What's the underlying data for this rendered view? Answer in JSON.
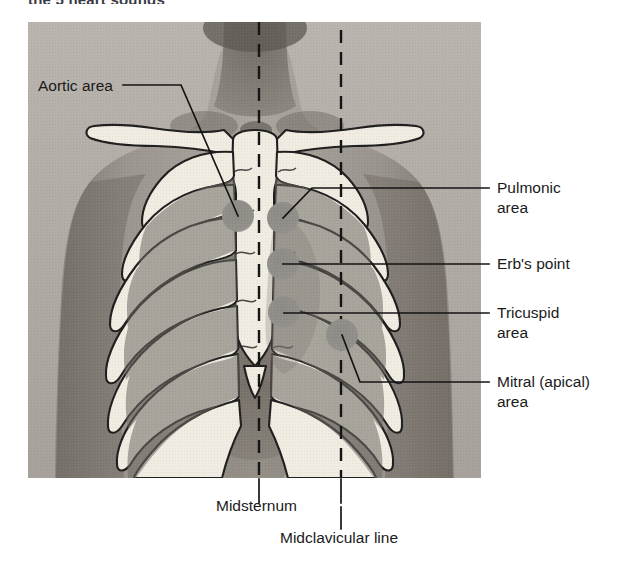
{
  "figure": {
    "title_clipped": "the 5 heart sounds",
    "kind": "anatomical-diagram"
  },
  "photo": {
    "alt_name": "male-torso-photograph",
    "overlay_name": "rib-cage-sternum-illustration",
    "bone_color": "#f0ece2",
    "bone_outline": "#1f1f1f",
    "shadow_color": "#6e6a64",
    "skin_mid": "#9a9591",
    "skin_light": "#c3bfb9",
    "skin_dark": "#6d6862",
    "marker_color": "#8d8a85",
    "line_color": "#1a1a1a"
  },
  "labels": {
    "aortic": "Aortic area",
    "pulmonic_line1": "Pulmonic",
    "pulmonic_line2": "area",
    "erbs": "Erb's point",
    "tricuspid_line1": "Tricuspid",
    "tricuspid_line2": "area",
    "mitral_line1": "Mitral (apical)",
    "mitral_line2": "area",
    "midsternum": "Midsternum",
    "midclavicular": "Midclavicular line"
  },
  "reference_lines": [
    {
      "name": "midsternum-dashed-line",
      "x": 259,
      "label": "Midsternum"
    },
    {
      "name": "midclavicular-dashed-line",
      "x": 341,
      "label": "Midclavicular line"
    }
  ],
  "auscultation_sites": [
    {
      "name": "aortic-area",
      "label": "Aortic area",
      "x": 238,
      "y": 216,
      "side": "left",
      "description": "2nd right intercostal space at the right sternal border"
    },
    {
      "name": "pulmonic-area",
      "label": "Pulmonic area",
      "x": 283,
      "y": 218,
      "side": "right",
      "description": "2nd left intercostal space at the left sternal border"
    },
    {
      "name": "erbs-point",
      "label": "Erb's point",
      "x": 283,
      "y": 264,
      "side": "right",
      "description": "3rd left intercostal space at the left sternal border"
    },
    {
      "name": "tricuspid-area",
      "label": "Tricuspid area",
      "x": 284,
      "y": 312,
      "side": "right",
      "description": "4th left intercostal space at the lower left sternal border"
    },
    {
      "name": "mitral-apical-area",
      "label": "Mitral (apical) area",
      "x": 342,
      "y": 335,
      "side": "right",
      "description": "5th left intercostal space at the midclavicular line"
    }
  ]
}
